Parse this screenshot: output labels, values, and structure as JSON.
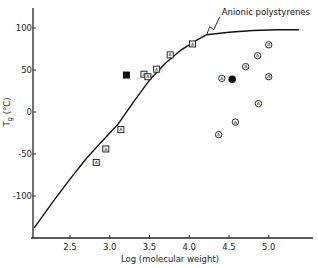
{
  "chart_data": {
    "type": "scatter",
    "title": "",
    "xlabel": "Log (molecular weight)",
    "ylabel": "Tg (°C)",
    "xlim": [
      2.0,
      5.55
    ],
    "ylim": [
      -150,
      120
    ],
    "xticks": [
      2.5,
      3.0,
      3.5,
      4.0,
      4.5,
      5.0
    ],
    "xtick_labels": [
      "2.5",
      "3.0",
      "3.5",
      "4.0",
      "4.5",
      "5.0"
    ],
    "yticks": [
      100,
      50,
      0,
      -50,
      -100
    ],
    "ytick_labels": [
      "100",
      "50",
      "0",
      "-50",
      "-100"
    ],
    "grid": false,
    "annotations": [
      {
        "text": "Anionic polystyrenes",
        "x": 4.22,
        "y": 92
      }
    ],
    "series": [
      {
        "name": "Anionic polystyrenes",
        "kind": "line",
        "x": [
          2.05,
          2.3,
          2.5,
          2.7,
          2.9,
          3.1,
          3.3,
          3.5,
          3.7,
          3.9,
          4.1,
          4.22,
          4.5,
          4.8,
          5.1,
          5.38
        ],
        "y": [
          -138,
          -105,
          -80,
          -56,
          -35,
          -15,
          12,
          38,
          58,
          74,
          86,
          92,
          95,
          97,
          98,
          98
        ]
      },
      {
        "name": "Labelled squares (open)",
        "kind": "scatter",
        "marker": "square-open",
        "x": [
          2.83,
          2.95,
          3.14,
          3.43,
          3.48,
          3.59,
          3.76,
          4.04
        ],
        "y": [
          -60,
          -44,
          -21,
          45,
          42,
          51,
          68,
          81
        ]
      },
      {
        "name": "Solid square",
        "kind": "scatter",
        "marker": "square-filled",
        "x": [
          3.21
        ],
        "y": [
          44
        ]
      },
      {
        "name": "Labelled circles (open)",
        "kind": "scatter",
        "marker": "circle-open",
        "x": [
          4.41,
          4.71,
          4.86,
          5.0,
          5.0,
          4.87,
          4.58,
          4.37
        ],
        "y": [
          40,
          54,
          67,
          80,
          42,
          10,
          -12,
          -27
        ]
      },
      {
        "name": "Solid circle",
        "kind": "scatter",
        "marker": "circle-filled",
        "x": [
          4.54
        ],
        "y": [
          39
        ]
      }
    ]
  },
  "labels": {
    "xlabel": "Log (molecular weight)",
    "ylabel": "Tg (°C)",
    "annotation": "Anionic polystyrenes"
  }
}
